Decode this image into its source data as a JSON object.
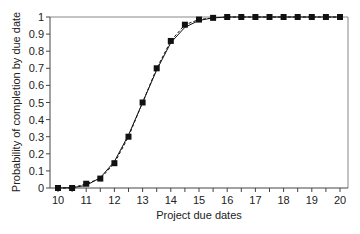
{
  "chart_data": {
    "type": "line",
    "title": "",
    "xlabel": "Project due dates",
    "ylabel": "Probability of completion by due date",
    "xlim": [
      10,
      20
    ],
    "ylim": [
      0,
      1
    ],
    "x_ticks": [
      10,
      11,
      12,
      13,
      14,
      15,
      16,
      17,
      18,
      19,
      20
    ],
    "y_ticks": [
      0,
      0.1,
      0.2,
      0.3,
      0.4,
      0.5,
      0.6,
      0.7,
      0.8,
      0.9,
      1
    ],
    "y_tick_labels": [
      "0",
      "0.1",
      "0.2",
      "0.3",
      "0.4",
      "0.5",
      "0.6",
      "0.7",
      "0.8",
      "0.9",
      "1"
    ],
    "grid": false,
    "legend": null,
    "x": [
      10,
      10.5,
      11,
      11.5,
      12,
      12.5,
      13,
      13.5,
      14,
      14.5,
      15,
      15.5,
      16,
      16.5,
      17,
      17.5,
      18,
      18.5,
      19,
      19.5,
      20
    ],
    "series": [
      {
        "name": "Simulated (markers, dashed)",
        "style": "dashed-square-markers",
        "values": [
          0,
          0,
          0.025,
          0.055,
          0.145,
          0.3,
          0.5,
          0.7,
          0.86,
          0.955,
          0.985,
          0.995,
          1,
          1,
          1,
          1,
          1,
          1,
          1,
          1,
          1
        ]
      },
      {
        "name": "Analytical (solid)",
        "style": "solid",
        "values": [
          0,
          0.002,
          0.015,
          0.06,
          0.155,
          0.31,
          0.5,
          0.69,
          0.85,
          0.94,
          0.98,
          0.995,
          1,
          1,
          1,
          1,
          1,
          1,
          1,
          1,
          1
        ]
      }
    ]
  }
}
